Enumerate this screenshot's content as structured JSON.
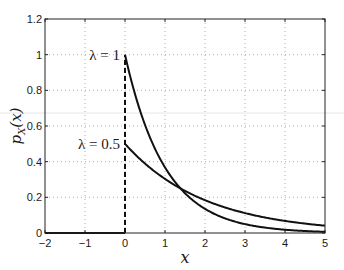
{
  "chart_data": {
    "type": "line",
    "title": "",
    "xlabel": "x",
    "ylabel": "p_X(x)",
    "xlim": [
      -2,
      5
    ],
    "ylim": [
      0,
      1.2
    ],
    "xticks": [
      -2,
      -1,
      0,
      1,
      2,
      3,
      4,
      5
    ],
    "xtick_labels": [
      "−2",
      "−1",
      "0",
      "1",
      "2",
      "3",
      "4",
      "5"
    ],
    "yticks": [
      0,
      0.2,
      0.4,
      0.6,
      0.8,
      1,
      1.2
    ],
    "ytick_labels": [
      "0",
      "0.2",
      "0.4",
      "0.6",
      "0.8",
      "1",
      "1.2"
    ],
    "grid": true,
    "series": [
      {
        "name": "λ = 1",
        "lambda": 1,
        "function": "lambda*exp(-lambda*x) for x>=0, 0 for x<0",
        "color": "#111111"
      },
      {
        "name": "λ = 0.5",
        "lambda": 0.5,
        "function": "lambda*exp(-lambda*x) for x>=0, 0 for x<0",
        "color": "#111111"
      }
    ],
    "vertical_dashed_line": {
      "x": 0,
      "y_range": [
        0,
        1
      ]
    },
    "annotations": [
      {
        "text": "λ = 1",
        "x": 0,
        "y": 1,
        "anchor": "left-of-point"
      },
      {
        "text": "λ = 0.5",
        "x": 0,
        "y": 0.5,
        "anchor": "left-of-point"
      }
    ]
  }
}
